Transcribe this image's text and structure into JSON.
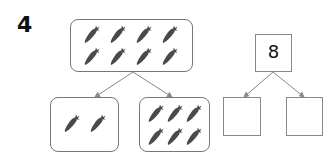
{
  "problem": {
    "number": "4"
  },
  "picture_tree": {
    "whole": {
      "count": 8,
      "icon": "carrot-icon"
    },
    "part_left": {
      "count": 2,
      "icon": "carrot-icon"
    },
    "part_right": {
      "count": 6,
      "icon": "carrot-icon"
    }
  },
  "number_bond": {
    "whole": "8",
    "part_left": "",
    "part_right": ""
  },
  "colors": {
    "carrot": "#4a4a4a",
    "border": "#777777",
    "arrow": "#888888"
  }
}
